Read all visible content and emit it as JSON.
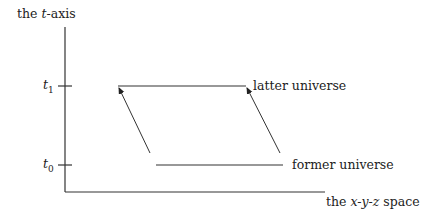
{
  "diagram": {
    "y_axis_label": {
      "prefix": "the ",
      "var": "t",
      "suffix": "-axis"
    },
    "x_axis_label": {
      "prefix": "the ",
      "var": "x-y-z",
      "suffix": " space"
    },
    "ticks": [
      {
        "name": "t1",
        "base": "t",
        "sub": "1"
      },
      {
        "name": "t0",
        "base": "t",
        "sub": "0"
      }
    ],
    "universes": {
      "latter": "latter universe",
      "former": "former universe"
    },
    "colors": {
      "line": "#333333",
      "text": "#222222",
      "background": "#ffffff"
    }
  }
}
